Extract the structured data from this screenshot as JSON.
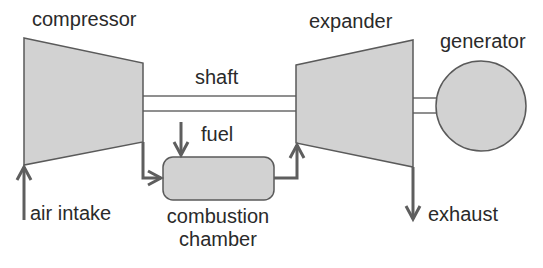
{
  "diagram": {
    "type": "gas turbine schematic",
    "components": {
      "compressor": {
        "label": "compressor"
      },
      "shaft": {
        "label": "shaft"
      },
      "expander": {
        "label": "expander"
      },
      "generator": {
        "label": "generator"
      },
      "combustion_chamber": {
        "label_line1": "combustion",
        "label_line2": "chamber"
      }
    },
    "flows": {
      "air_intake": {
        "label": "air intake"
      },
      "fuel": {
        "label": "fuel"
      },
      "exhaust": {
        "label": "exhaust"
      }
    },
    "colors": {
      "shape_fill": "#d2d2d2",
      "shape_stroke": "#5a5a5a",
      "arrow": "#5e5e5e",
      "text": "#2a2a2a"
    }
  }
}
